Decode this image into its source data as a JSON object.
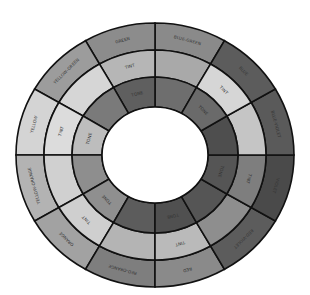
{
  "diagram": {
    "type": "color-wheel",
    "geometry": {
      "cx": 155,
      "cy": 155,
      "rings_rx": [
        139,
        111,
        83,
        53
      ],
      "rings_ry": [
        132,
        105,
        78,
        48
      ]
    },
    "ring_labels": {
      "outer": "hue",
      "middle": "TINT",
      "inner": "TONE"
    },
    "segments": [
      {
        "name": "BLUE-GREEN",
        "start": 60,
        "end": 90,
        "outer": "#8a8a8a",
        "middle": "#a9a9a9",
        "inner": "#6e6e6e",
        "show_tint": false,
        "show_tone": false
      },
      {
        "name": "GREEN",
        "start": 90,
        "end": 120,
        "outer": "#8c8c8c",
        "middle": "#b6b6b6",
        "inner": "#5f5f5f",
        "show_tint": true,
        "show_tone": true
      },
      {
        "name": "YELLOW-GREEN",
        "start": 120,
        "end": 150,
        "outer": "#9c9c9c",
        "middle": "#d6d6d6",
        "inner": "#7a7a7a",
        "show_tint": false,
        "show_tone": false
      },
      {
        "name": "YELLOW",
        "start": 150,
        "end": 180,
        "outer": "#d4d4d4",
        "middle": "#dcdcdc",
        "inner": "#bdbdbd",
        "show_tint": true,
        "show_tone": true
      },
      {
        "name": "YELLOW-ORANGE",
        "start": 180,
        "end": 210,
        "outer": "#b3b3b3",
        "middle": "#d0d0d0",
        "inner": "#8e8e8e",
        "show_tint": false,
        "show_tone": false
      },
      {
        "name": "ORANGE",
        "start": 210,
        "end": 240,
        "outer": "#a2a2a2",
        "middle": "#cfcfcf",
        "inner": "#8f8f8f",
        "show_tint": true,
        "show_tone": true
      },
      {
        "name": "RED-ORANGE",
        "start": 240,
        "end": 270,
        "outer": "#7e7e7e",
        "middle": "#b4b4b4",
        "inner": "#5c5c5c",
        "show_tint": false,
        "show_tone": false
      },
      {
        "name": "RED",
        "start": 270,
        "end": 300,
        "outer": "#8a8a8a",
        "middle": "#bababa",
        "inner": "#505050",
        "show_tint": true,
        "show_tone": true
      },
      {
        "name": "RED-VIOLET",
        "start": 300,
        "end": 330,
        "outer": "#5c5c5c",
        "middle": "#8e8e8e",
        "inner": "#555555",
        "show_tint": false,
        "show_tone": false
      },
      {
        "name": "VIOLET",
        "start": 330,
        "end": 360,
        "outer": "#4a4a4a",
        "middle": "#7e7e7e",
        "inner": "#555555",
        "show_tint": true,
        "show_tone": true
      },
      {
        "name": "BLUE-VIOLET",
        "start": 0,
        "end": 30,
        "outer": "#5a5a5a",
        "middle": "#c5c5c5",
        "inner": "#4e4e4e",
        "show_tint": false,
        "show_tone": false
      },
      {
        "name": "BLUE",
        "start": 30,
        "end": 60,
        "outer": "#5c5c5c",
        "middle": "#d6d6d6",
        "inner": "#6a6a6a",
        "show_tint": true,
        "show_tone": true
      }
    ],
    "colors": {
      "stroke": "#111111",
      "center": "#ffffff",
      "label": "#333333"
    }
  }
}
